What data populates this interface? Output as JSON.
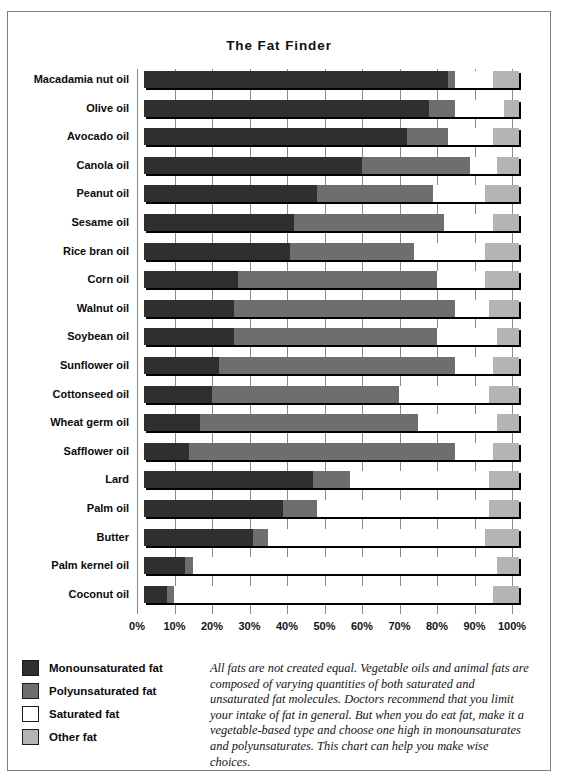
{
  "chart_data": {
    "type": "bar",
    "subtype": "stacked-horizontal-100-percent",
    "title": "The Fat Finder",
    "xlabel": "",
    "ylabel": "",
    "xlim": [
      0,
      100
    ],
    "xticks": [
      "0%",
      "10%",
      "20%",
      "30%",
      "40%",
      "50%",
      "60%",
      "70%",
      "80%",
      "90%",
      "100%"
    ],
    "xtick_values": [
      0,
      10,
      20,
      30,
      40,
      50,
      60,
      70,
      80,
      90,
      100
    ],
    "grid": true,
    "legend_position": "bottom-left",
    "categories": [
      "Macadamia nut oil",
      "Olive oil",
      "Avocado oil",
      "Canola oil",
      "Peanut oil",
      "Sesame oil",
      "Rice bran oil",
      "Corn oil",
      "Walnut oil",
      "Soybean oil",
      "Sunflower oil",
      "Cottonseed oil",
      "Wheat germ oil",
      "Safflower oil",
      "Lard",
      "Palm oil",
      "Butter",
      "Palm kernel oil",
      "Coconut oil"
    ],
    "series": [
      {
        "name": "Monounsaturated fat",
        "color": "#2f2f2f",
        "values": [
          81,
          76,
          70,
          58,
          46,
          40,
          39,
          25,
          24,
          24,
          20,
          18,
          15,
          12,
          45,
          37,
          29,
          11,
          6
        ]
      },
      {
        "name": "Polyunsaturated fat",
        "color": "#6e6e6e",
        "values": [
          2,
          7,
          11,
          29,
          31,
          40,
          33,
          53,
          59,
          54,
          63,
          50,
          58,
          71,
          10,
          9,
          4,
          2,
          2
        ]
      },
      {
        "name": "Saturated fat",
        "color": "#ffffff",
        "values": [
          10,
          13,
          12,
          7,
          14,
          13,
          19,
          13,
          9,
          16,
          10,
          24,
          21,
          10,
          37,
          46,
          58,
          81,
          85
        ]
      },
      {
        "name": "Other fat",
        "color": "#b4b4b4",
        "values": [
          7,
          4,
          7,
          6,
          9,
          7,
          9,
          9,
          8,
          6,
          7,
          8,
          6,
          7,
          8,
          8,
          9,
          6,
          7
        ]
      }
    ]
  },
  "legend": {
    "items": [
      {
        "label": "Monounsaturated fat",
        "color": "#2f2f2f"
      },
      {
        "label": "Polyunsaturated fat",
        "color": "#6e6e6e"
      },
      {
        "label": "Saturated fat",
        "color": "#ffffff"
      },
      {
        "label": "Other fat",
        "color": "#b4b4b4"
      }
    ]
  },
  "caption": {
    "text": "All fats are not created equal. Vegetable oils and animal fats are composed of varying quantities of both saturated and unsaturated fat molecules. Doctors recommend that you limit your intake of fat in general. But when you do eat fat, make it a vegetable-based type and choose one high in monounsaturates and polyunsaturates. This chart can help you make wise choices."
  }
}
